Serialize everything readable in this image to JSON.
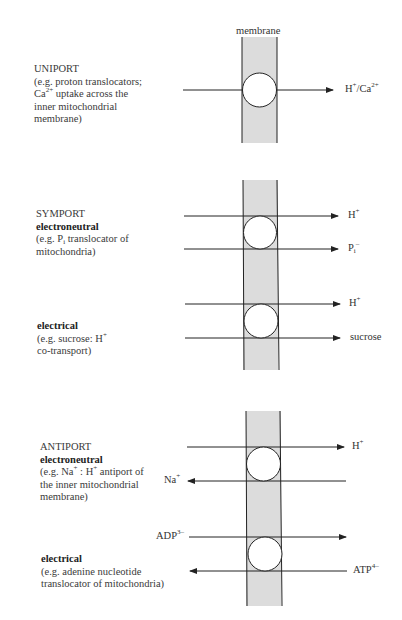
{
  "membrane_label": "membrane",
  "colors": {
    "membrane_fill": "#dcdcdc",
    "line": "#222222",
    "background": "#ffffff"
  },
  "sections": [
    {
      "id": "uniport",
      "title": "UNIPORT",
      "lines": [
        "(e.g. proton translocators;",
        "Ca",
        "2+",
        " uptake across the",
        "inner mitochondrial",
        "membrane)"
      ],
      "arrows": [
        {
          "direction": "right",
          "label": "H",
          "sup": "+",
          "label2": "/Ca",
          "sup2": "2+"
        }
      ]
    },
    {
      "id": "symport",
      "title": "SYMPORT",
      "subtypes": [
        {
          "name": "electroneutral",
          "desc": [
            "(e.g. P",
            "i",
            " translocator of",
            "mitochondria)"
          ],
          "arrows": [
            {
              "direction": "right",
              "label": "H",
              "sup": "+"
            },
            {
              "direction": "right",
              "label": "P",
              "sub": "i",
              "sup": "–"
            }
          ]
        },
        {
          "name": "electrical",
          "desc": [
            "(e.g. sucrose: H",
            "+",
            "co-transport)"
          ],
          "arrows": [
            {
              "direction": "right",
              "label": "H",
              "sup": "+"
            },
            {
              "direction": "right",
              "label": "sucrose"
            }
          ]
        }
      ]
    },
    {
      "id": "antiport",
      "title": "ANTIPORT",
      "subtypes": [
        {
          "name": "electroneutral",
          "desc": [
            "(e.g. Na",
            "+",
            " : H",
            "+",
            " antiport of",
            "the inner mitochondrial",
            "membrane)"
          ],
          "arrows": [
            {
              "direction": "right",
              "label": "H",
              "sup": "+"
            },
            {
              "direction": "left",
              "label": "Na",
              "sup": "+"
            }
          ]
        },
        {
          "name": "electrical",
          "desc": [
            "(e.g. adenine nucleotide",
            "translocator of mitochondria)"
          ],
          "arrows": [
            {
              "direction": "right",
              "label": "ADP",
              "sup": "3–"
            },
            {
              "direction": "left",
              "label": "ATP",
              "sup": "4–"
            }
          ]
        }
      ]
    }
  ]
}
